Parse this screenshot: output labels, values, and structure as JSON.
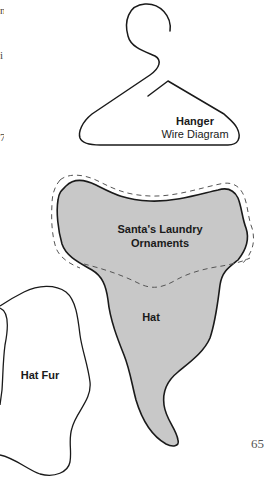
{
  "page": {
    "page_number": "65",
    "left_margin_fragments": [
      "n",
      "i",
      "7,"
    ]
  },
  "pattern_pieces": {
    "hanger": {
      "title": "Hanger",
      "subtitle": "Wire Diagram"
    },
    "ornament": {
      "title_line1": "Santa's Laundry",
      "title_line2": "Ornaments"
    },
    "hat": {
      "title": "Hat"
    },
    "hat_fur": {
      "title": "Hat Fur"
    }
  },
  "colors": {
    "fill_grey": "#c8c8c8",
    "outline": "#1a1a1a",
    "dashed": "#555555",
    "background": "#ffffff"
  }
}
